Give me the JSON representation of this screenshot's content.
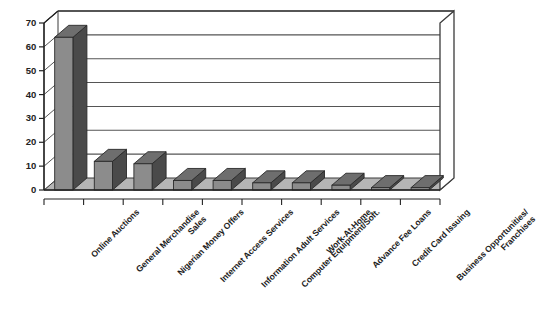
{
  "chart_data": {
    "type": "bar",
    "title": "",
    "subtitle": "",
    "xlabel": "",
    "ylabel": "",
    "ylim": [
      0,
      70
    ],
    "ytick_step": 10,
    "yticks": [
      "0",
      "10",
      "20",
      "30",
      "40",
      "50",
      "60",
      "70"
    ],
    "grid": true,
    "legend": false,
    "style": "3d-column",
    "bar_face_color": "#8c8c8c",
    "bar_side_color": "#4a4a4a",
    "bar_top_color": "#6e6e6e",
    "floor_color": "#b5b5b5",
    "back_wall_color": "#ffffff",
    "frame_color": "#3b3b3b",
    "categories": [
      "Online Auctions",
      "General Merchandise Sales",
      "Nigerian Money Offers",
      "Internet Access Services",
      "Information Adult Services",
      "Computer Equipment/Soft.",
      "Work-At-Home",
      "Advance Fee Loans",
      "Credit Card Issuing",
      "Business Opportunities/ Franchises"
    ],
    "category_label_lines": [
      [
        "Online Auctions"
      ],
      [
        "General Merchandise",
        "Sales"
      ],
      [
        "Nigerian Money Offers"
      ],
      [
        "Internet Access Services"
      ],
      [
        "Information Adult Services"
      ],
      [
        "Computer Equipment/Soft."
      ],
      [
        "Work-At-Home"
      ],
      [
        "Advance Fee Loans"
      ],
      [
        "Credit Card Issuing"
      ],
      [
        "Business Opportunities/",
        "Franchises"
      ]
    ],
    "values": [
      64,
      12,
      11,
      4,
      4,
      3,
      3,
      2,
      1,
      1
    ]
  }
}
